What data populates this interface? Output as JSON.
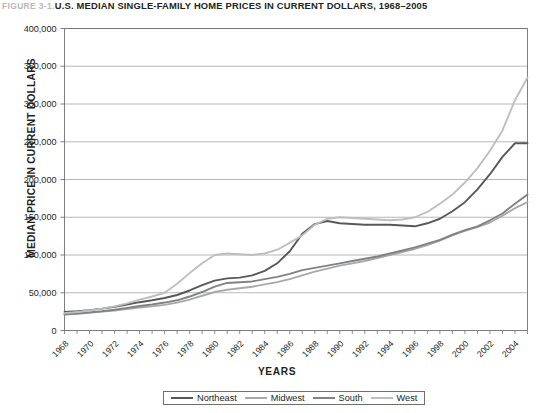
{
  "title": {
    "figure_number": "FIGURE 3-1.",
    "text": "U.S. MEDIAN SINGLE-FAMILY HOME PRICES IN CURRENT DOLLARS, 1968–2005"
  },
  "axes": {
    "ylabel": "MEDIAN PRICE IN CURRENT DOLLARS",
    "xlabel": "YEARS"
  },
  "legend": {
    "items": [
      {
        "label": "Northeast",
        "color": "#58585a"
      },
      {
        "label": "Midwest",
        "color": "#a7a9ac"
      },
      {
        "label": "South",
        "color": "#808285"
      },
      {
        "label": "West",
        "color": "#bcbec0"
      }
    ]
  },
  "chart_data": {
    "type": "line",
    "title": "U.S. MEDIAN SINGLE-FAMILY HOME PRICES IN CURRENT DOLLARS, 1968–2005",
    "xlabel": "YEARS",
    "ylabel": "MEDIAN PRICE IN CURRENT DOLLARS",
    "xlim": [
      1968,
      2005
    ],
    "ylim": [
      0,
      400000
    ],
    "yticks": [
      0,
      50000,
      100000,
      150000,
      200000,
      250000,
      300000,
      350000,
      400000
    ],
    "ytick_labels": [
      "0",
      "50,000",
      "100,000",
      "150,000",
      "200,000",
      "250,000",
      "300,000",
      "350,000",
      "400,000"
    ],
    "xticks": [
      1968,
      1970,
      1972,
      1974,
      1976,
      1978,
      1980,
      1982,
      1984,
      1986,
      1988,
      1990,
      1992,
      1994,
      1996,
      1998,
      2000,
      2002,
      2004
    ],
    "xtick_labels": [
      "1968",
      "1970",
      "1972",
      "1974",
      "1976",
      "1978",
      "1980",
      "1982",
      "1984",
      "1986",
      "1988",
      "1990",
      "1992",
      "1994",
      "1996",
      "1998",
      "2000",
      "2002",
      "2004"
    ],
    "grid": "horizontal",
    "legend_position": "bottom",
    "x": [
      1968,
      1969,
      1970,
      1971,
      1972,
      1973,
      1974,
      1975,
      1976,
      1977,
      1978,
      1979,
      1980,
      1981,
      1982,
      1983,
      1984,
      1985,
      1986,
      1987,
      1988,
      1989,
      1990,
      1991,
      1992,
      1993,
      1994,
      1995,
      1996,
      1997,
      1998,
      1999,
      2000,
      2001,
      2002,
      2003,
      2004,
      2005
    ],
    "series": [
      {
        "name": "Northeast",
        "color": "#58585a",
        "values": [
          24500,
          25500,
          27000,
          29000,
          31500,
          34500,
          37500,
          40000,
          43000,
          47000,
          53000,
          60000,
          66000,
          69000,
          70000,
          73000,
          79000,
          89000,
          105000,
          128000,
          141000,
          145000,
          142000,
          141000,
          140000,
          140000,
          140000,
          139000,
          138000,
          142000,
          148000,
          158000,
          170000,
          187000,
          207000,
          230000,
          248000,
          248000
        ]
      },
      {
        "name": "Midwest",
        "color": "#a7a9ac",
        "values": [
          21000,
          22000,
          23500,
          25000,
          26500,
          28500,
          30500,
          32000,
          34000,
          37000,
          41000,
          46000,
          51000,
          54000,
          56000,
          58000,
          61000,
          64000,
          68000,
          73000,
          78000,
          82000,
          86000,
          89000,
          92000,
          96000,
          100000,
          104000,
          108000,
          113000,
          119000,
          126000,
          132000,
          137000,
          143000,
          152000,
          162000,
          170000
        ]
      },
      {
        "name": "South",
        "color": "#808285",
        "values": [
          21500,
          22500,
          24000,
          25500,
          27500,
          30000,
          32500,
          34500,
          37000,
          40000,
          45000,
          51000,
          58000,
          63000,
          64000,
          65000,
          68000,
          71000,
          75000,
          80000,
          83000,
          86000,
          89000,
          92000,
          95000,
          98000,
          102000,
          106000,
          110000,
          115000,
          120000,
          127000,
          133000,
          138000,
          146000,
          155000,
          168000,
          180000
        ]
      },
      {
        "name": "West",
        "color": "#bcbec0",
        "values": [
          23000,
          24500,
          26500,
          29000,
          32000,
          36000,
          41000,
          45000,
          50000,
          62000,
          76000,
          89000,
          100000,
          102000,
          101000,
          100000,
          102000,
          107000,
          116000,
          126000,
          140000,
          148000,
          150000,
          149000,
          148000,
          147000,
          146000,
          147000,
          150000,
          157000,
          168000,
          180000,
          196000,
          215000,
          238000,
          265000,
          305000,
          335000
        ]
      }
    ]
  }
}
